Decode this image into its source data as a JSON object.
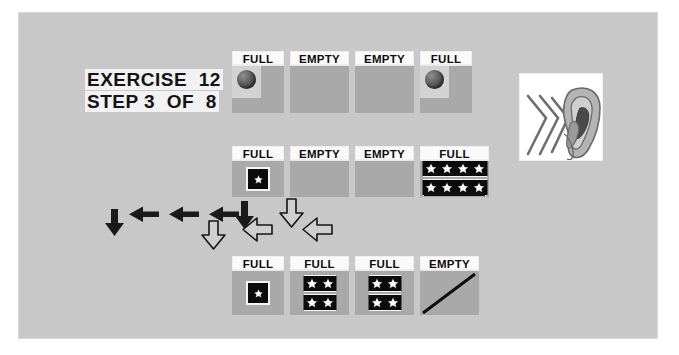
{
  "exercise": {
    "line1": "EXERCISE  12",
    "line2": "STEP 3  OF  8"
  },
  "colors": {
    "frame_background": "#c8c8c8",
    "cell_body": "#a9a9a9",
    "cell_label_background": "#fafafa",
    "strip_background": "#0b0b0b",
    "text": "#0d0d0d",
    "arrow_solid": "#1a1a1a",
    "arrow_outline_fill": "#cfcfcf",
    "arrow_outline_stroke": "#141414"
  },
  "rows": [
    {
      "name": "top-row",
      "cells": [
        {
          "label": "FULL",
          "content": "ball",
          "stars": 0
        },
        {
          "label": "EMPTY",
          "content": "none",
          "stars": 0
        },
        {
          "label": "EMPTY",
          "content": "none",
          "stars": 0
        },
        {
          "label": "FULL",
          "content": "ball",
          "stars": 0
        }
      ]
    },
    {
      "name": "middle-row",
      "cells": [
        {
          "label": "FULL",
          "content": "single-star",
          "stars": 1
        },
        {
          "label": "EMPTY",
          "content": "none",
          "stars": 0
        },
        {
          "label": "EMPTY",
          "content": "none",
          "stars": 0
        },
        {
          "label": "FULL",
          "content": "star-grid",
          "stars": 8
        }
      ]
    },
    {
      "name": "bottom-row",
      "cells": [
        {
          "label": "FULL",
          "content": "single-star",
          "stars": 1
        },
        {
          "label": "FULL",
          "content": "star-grid",
          "stars": 4
        },
        {
          "label": "FULL",
          "content": "star-grid",
          "stars": 4
        },
        {
          "label": "EMPTY",
          "content": "slash",
          "stars": 0
        }
      ]
    }
  ],
  "arrows": {
    "solid": [
      {
        "name": "arrow-down-solid-left",
        "direction": "down"
      },
      {
        "name": "arrow-left-solid-1",
        "direction": "left"
      },
      {
        "name": "arrow-left-solid-2",
        "direction": "left"
      },
      {
        "name": "arrow-left-solid-3",
        "direction": "left"
      },
      {
        "name": "arrow-down-solid-right",
        "direction": "down"
      }
    ],
    "outline": [
      {
        "name": "arrow-down-outline-top-right",
        "direction": "down"
      },
      {
        "name": "arrow-down-outline-center",
        "direction": "down"
      },
      {
        "name": "arrow-left-outline-1",
        "direction": "left"
      },
      {
        "name": "arrow-left-outline-2",
        "direction": "left"
      }
    ]
  },
  "illustration": {
    "name": "ear-with-sound-waves",
    "alt_text": "Ear receiving sound waves"
  }
}
